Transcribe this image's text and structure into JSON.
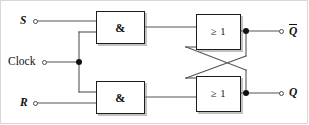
{
  "diagram": {
    "inputs": [
      {
        "id": "s",
        "label": "S",
        "style": "italic",
        "terminal": "open-circle"
      },
      {
        "id": "clock",
        "label": "Clock",
        "style": "upright",
        "terminal": "open-circle"
      },
      {
        "id": "r",
        "label": "R",
        "style": "italic",
        "terminal": "open-circle"
      }
    ],
    "outputs": [
      {
        "id": "qbar",
        "label": "Q",
        "overline": true,
        "style": "italic",
        "terminal": "open-circle"
      },
      {
        "id": "q",
        "label": "Q",
        "overline": false,
        "style": "italic",
        "terminal": "open-circle"
      }
    ],
    "gates": [
      {
        "id": "and-top",
        "type": "AND",
        "label": "&",
        "inputs": [
          "S",
          "Clock"
        ],
        "output": "s-and"
      },
      {
        "id": "and-bottom",
        "type": "AND",
        "label": "&",
        "inputs": [
          "R",
          "Clock"
        ],
        "output": "r-and"
      },
      {
        "id": "or-top",
        "type": "OR",
        "label": "≥ 1",
        "inputs": [
          "s-and",
          "Q"
        ],
        "output": "Qbar"
      },
      {
        "id": "or-bottom",
        "type": "OR",
        "label": "≥ 1",
        "inputs": [
          "r-and",
          "Qbar"
        ],
        "output": "Q"
      }
    ],
    "junctions": [
      {
        "id": "clock-fanout",
        "on": "Clock wire",
        "type": "solid-dot"
      },
      {
        "id": "qbar-tap",
        "on": "top OR output",
        "type": "solid-dot"
      },
      {
        "id": "q-tap",
        "on": "bottom OR output",
        "type": "solid-dot"
      }
    ],
    "colors": {
      "background": "#ffffff",
      "wire": "#555555",
      "gate_border": "#1c1c1c",
      "text": "#111111",
      "frame": "#d8d8d8",
      "shadow": "rgba(120,120,120,0.45)"
    }
  }
}
